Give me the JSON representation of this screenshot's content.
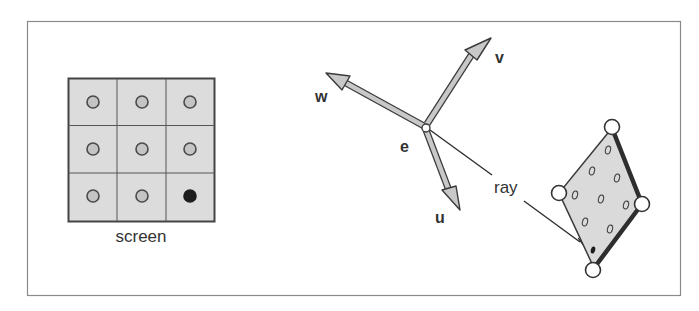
{
  "figure": {
    "frame": {
      "x": 27,
      "y": 21,
      "width": 654,
      "height": 275,
      "stroke": "#8a8a8a"
    },
    "colors": {
      "cell_fill": "#dcdcdc",
      "grid_line": "#555555",
      "pixel_dot_fill": "#c4c4c4",
      "pixel_dot_stroke": "#4a4a4a",
      "selected_pixel": "#1e1e1e",
      "arrow_fill": "#c8c8c8",
      "arrow_stroke": "#3a3a3a",
      "polygon_fill": "#dadada",
      "polygon_edge": "#2e2e2e",
      "text": "#333333"
    }
  },
  "screen": {
    "label": "screen",
    "rows": 3,
    "cols": 3,
    "selected_pixel": {
      "row": 2,
      "col": 2
    }
  },
  "camera": {
    "eye_label": "e",
    "basis": [
      {
        "name": "u",
        "label": "u"
      },
      {
        "name": "v",
        "label": "v"
      },
      {
        "name": "w",
        "label": "w"
      }
    ]
  },
  "ray": {
    "label": "ray"
  },
  "polygon": {
    "vertex_count": 4,
    "sample_count": 9,
    "hit_point": true
  }
}
